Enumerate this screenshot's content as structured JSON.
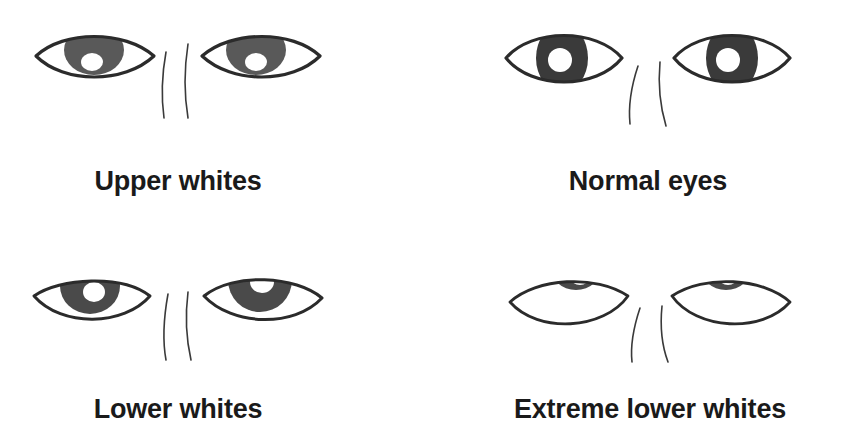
{
  "figure": {
    "background_color": "#ffffff",
    "ink_color": "#2b2b2b",
    "label_color": "#1a1a1a",
    "iris_color_light": "#595959",
    "iris_color_dark": "#3a3a3a",
    "sclera_color": "#ffffff",
    "pupil_highlight_color": "#ffffff"
  },
  "panels": [
    {
      "id": "upper-whites",
      "label": "Upper whites",
      "description": "Iris hangs from the upper lid, white sclera visible below the iris",
      "iris_vertical_position": "top",
      "iris_size": "medium",
      "visible_sclera": "below"
    },
    {
      "id": "normal-eyes",
      "label": "Normal eyes",
      "description": "Large iris centered and filling the eye opening vertically",
      "iris_vertical_position": "center",
      "iris_size": "large",
      "visible_sclera": "sides"
    },
    {
      "id": "lower-whites",
      "label": "Lower whites",
      "description": "Iris pressed against the upper lid with white sclera showing below",
      "iris_vertical_position": "top",
      "iris_size": "large",
      "visible_sclera": "below"
    },
    {
      "id": "extreme-lower-whites",
      "label": "Extreme lower whites",
      "description": "Iris almost entirely hidden under the upper lid, broad white sclera below",
      "iris_vertical_position": "clipped-top",
      "iris_size": "small",
      "visible_sclera": "below-wide"
    }
  ]
}
